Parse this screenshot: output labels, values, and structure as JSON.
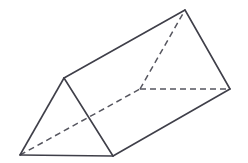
{
  "figure": {
    "shape_name": "triangular-prism",
    "background_color": "#ffffff",
    "stroke_color": "#3f3f49",
    "hidden_stroke_color": "#56565f",
    "face_color": "#ffffff",
    "stroke_width": 1.6,
    "hidden_stroke_width": 1.5,
    "hidden_dash_pattern": "6,4",
    "canvas": {
      "width": 248,
      "height": 163
    },
    "vertices": {
      "near_bottom_left": {
        "x": 20,
        "y": 155,
        "label": "A",
        "visible": true
      },
      "near_apex": {
        "x": 64,
        "y": 78,
        "label": "B",
        "visible": true
      },
      "near_bottom_right": {
        "x": 113,
        "y": 156,
        "label": "C",
        "visible": true
      },
      "far_hidden": {
        "x": 140,
        "y": 89,
        "label": "D",
        "visible": false
      },
      "far_apex": {
        "x": 185,
        "y": 10,
        "label": "E",
        "visible": true
      },
      "far_right": {
        "x": 230,
        "y": 89,
        "label": "F",
        "visible": true
      }
    },
    "edges": [
      {
        "name": "near-bottom-edge",
        "from": "near_bottom_left",
        "to": "near_bottom_right",
        "style": "solid"
      },
      {
        "name": "near-left-edge",
        "from": "near_bottom_left",
        "to": "near_apex",
        "style": "solid"
      },
      {
        "name": "near-right-edge",
        "from": "near_apex",
        "to": "near_bottom_right",
        "style": "solid"
      },
      {
        "name": "top-ridge-edge",
        "from": "near_apex",
        "to": "far_apex",
        "style": "solid"
      },
      {
        "name": "lower-right-long-edge",
        "from": "near_bottom_right",
        "to": "far_right",
        "style": "solid"
      },
      {
        "name": "far-upper-right-edge",
        "from": "far_apex",
        "to": "far_right",
        "style": "solid"
      },
      {
        "name": "hidden-long-edge",
        "from": "near_bottom_left",
        "to": "far_hidden",
        "style": "dashed"
      },
      {
        "name": "far-hidden-left-edge",
        "from": "far_hidden",
        "to": "far_apex",
        "style": "dashed"
      },
      {
        "name": "far-hidden-bottom-edge",
        "from": "far_hidden",
        "to": "far_right",
        "style": "dashed"
      }
    ],
    "faces": [
      {
        "name": "near-triangle-face",
        "points": "20,155 64,78 113,156"
      },
      {
        "name": "top-rectangular-face",
        "points": "20,155 64,78 185,10 140,89"
      },
      {
        "name": "front-right-rectangular-face",
        "points": "64,78 185,10 230,89 113,156"
      },
      {
        "name": "bottom-rectangular-face",
        "points": "20,155 113,156 230,89 140,89"
      },
      {
        "name": "far-triangle-face",
        "points": "140,89 185,10 230,89"
      }
    ]
  }
}
